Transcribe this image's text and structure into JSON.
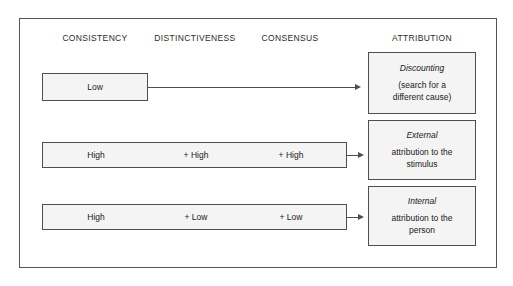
{
  "diagram": {
    "headers": [
      {
        "label": "CONSISTENCY"
      },
      {
        "label": "DISTINCTIVENESS"
      },
      {
        "label": "CONSENSUS"
      },
      {
        "label": "ATTRIBUTION"
      }
    ],
    "rows": [
      {
        "id": "discounting",
        "cells": [
          {
            "label": "Low"
          }
        ],
        "arrow": "long-arrow-right",
        "outcome": {
          "title": "Discounting",
          "detail": "(search for a\ndifferent cause)"
        }
      },
      {
        "id": "external",
        "cells": [
          {
            "label": "High"
          },
          {
            "label": "+ High"
          },
          {
            "label": "+ High"
          }
        ],
        "arrow": "short-arrow-right",
        "outcome": {
          "title": "External",
          "detail": "attribution to the\nstimulus"
        }
      },
      {
        "id": "internal",
        "cells": [
          {
            "label": "High"
          },
          {
            "label": "+ Low"
          },
          {
            "label": "+ Low"
          }
        ],
        "arrow": "short-arrow-right",
        "outcome": {
          "title": "Internal",
          "detail": "attribution to the\nperson"
        }
      }
    ],
    "colors": {
      "box_fill": "#f4f4f4",
      "box_border": "#4e4e4e",
      "frame_border": "#555555",
      "text": "#1a1a1a",
      "background": "#ffffff"
    }
  }
}
